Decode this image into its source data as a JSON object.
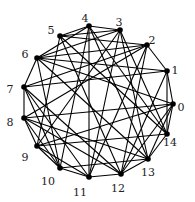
{
  "diagram": {
    "type": "graph",
    "colors": {
      "edge": "#000000",
      "node": "#000000",
      "label": "#222222",
      "background": "#ffffff"
    },
    "nodes": [
      {
        "id": "0",
        "x": 173,
        "y": 104,
        "lx": 181,
        "ly": 108
      },
      {
        "id": "1",
        "x": 167,
        "y": 71,
        "lx": 175,
        "ly": 71
      },
      {
        "id": "2",
        "x": 147,
        "y": 45,
        "lx": 152,
        "ly": 41
      },
      {
        "id": "3",
        "x": 120,
        "y": 30,
        "lx": 119,
        "ly": 23
      },
      {
        "id": "4",
        "x": 89,
        "y": 26,
        "lx": 85,
        "ly": 19
      },
      {
        "id": "5",
        "x": 60,
        "y": 36,
        "lx": 51,
        "ly": 31
      },
      {
        "id": "6",
        "x": 37,
        "y": 58,
        "lx": 25,
        "ly": 55
      },
      {
        "id": "7",
        "x": 24,
        "y": 87,
        "lx": 10,
        "ly": 90
      },
      {
        "id": "8",
        "x": 24,
        "y": 118,
        "lx": 10,
        "ly": 123
      },
      {
        "id": "9",
        "x": 37,
        "y": 146,
        "lx": 25,
        "ly": 158
      },
      {
        "id": "10",
        "x": 60,
        "y": 168,
        "lx": 48,
        "ly": 182
      },
      {
        "id": "11",
        "x": 89,
        "y": 177,
        "lx": 80,
        "ly": 193
      },
      {
        "id": "12",
        "x": 121,
        "y": 174,
        "lx": 118,
        "ly": 189
      },
      {
        "id": "13",
        "x": 148,
        "y": 159,
        "lx": 148,
        "ly": 173
      },
      {
        "id": "14",
        "x": 167,
        "y": 134,
        "lx": 170,
        "ly": 143
      }
    ],
    "edges": [
      [
        "0",
        "14"
      ],
      [
        "0",
        "1"
      ],
      [
        "0",
        "13"
      ],
      [
        "0",
        "12"
      ],
      [
        "0",
        "8"
      ],
      [
        "0",
        "9"
      ],
      [
        "0",
        "6"
      ],
      [
        "1",
        "14"
      ],
      [
        "1",
        "6"
      ],
      [
        "1",
        "7"
      ],
      [
        "1",
        "12"
      ],
      [
        "1",
        "2"
      ],
      [
        "2",
        "5"
      ],
      [
        "2",
        "6"
      ],
      [
        "2",
        "7"
      ],
      [
        "2",
        "8"
      ],
      [
        "2",
        "11"
      ],
      [
        "2",
        "12"
      ],
      [
        "3",
        "4"
      ],
      [
        "3",
        "5"
      ],
      [
        "3",
        "6"
      ],
      [
        "3",
        "9"
      ],
      [
        "3",
        "11"
      ],
      [
        "3",
        "13"
      ],
      [
        "4",
        "5"
      ],
      [
        "4",
        "6"
      ],
      [
        "4",
        "10"
      ],
      [
        "4",
        "11"
      ],
      [
        "4",
        "13"
      ],
      [
        "4",
        "14"
      ],
      [
        "5",
        "12"
      ],
      [
        "5",
        "14"
      ],
      [
        "5",
        "9"
      ],
      [
        "6",
        "7"
      ],
      [
        "6",
        "13"
      ],
      [
        "6",
        "10"
      ],
      [
        "7",
        "8"
      ],
      [
        "7",
        "11"
      ],
      [
        "7",
        "12"
      ],
      [
        "7",
        "10"
      ],
      [
        "8",
        "9"
      ],
      [
        "8",
        "12"
      ],
      [
        "8",
        "13"
      ],
      [
        "8",
        "10"
      ],
      [
        "9",
        "10"
      ],
      [
        "9",
        "14"
      ],
      [
        "9",
        "11"
      ],
      [
        "10",
        "11"
      ],
      [
        "10",
        "13"
      ],
      [
        "11",
        "12"
      ],
      [
        "12",
        "13"
      ],
      [
        "13",
        "14"
      ],
      [
        "14",
        "3"
      ]
    ]
  }
}
